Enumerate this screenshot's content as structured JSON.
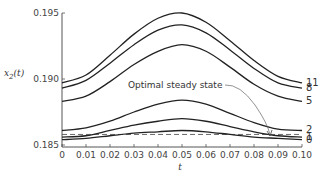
{
  "chart_data": {
    "type": "line",
    "title": "",
    "xlabel": "t",
    "ylabel": "x2(t)",
    "xlim": [
      0,
      0.1
    ],
    "ylim": [
      0.185,
      0.195
    ],
    "grid": false,
    "legend_position": "inline-right",
    "x_ticks": [
      "0",
      "0.01",
      "0.02",
      "0.03",
      "0.04",
      "0.05",
      "0.06",
      "0.07",
      "0.08",
      "0.09",
      "0.10"
    ],
    "y_ticks": [
      "0.185",
      "0.190",
      "0.195"
    ],
    "x": [
      0,
      0.01,
      0.02,
      0.03,
      0.04,
      0.05,
      0.06,
      0.07,
      0.08,
      0.09,
      0.1
    ],
    "series": [
      {
        "name": "11",
        "values": [
          0.1897,
          0.1903,
          0.1918,
          0.1934,
          0.1946,
          0.195,
          0.1943,
          0.1929,
          0.1914,
          0.1902,
          0.1897
        ]
      },
      {
        "name": "8",
        "values": [
          0.1893,
          0.1899,
          0.1912,
          0.1926,
          0.1937,
          0.1941,
          0.1935,
          0.1922,
          0.1908,
          0.1897,
          0.1893
        ]
      },
      {
        "name": "5",
        "values": [
          0.1883,
          0.1887,
          0.1898,
          0.1911,
          0.1921,
          0.1926,
          0.1921,
          0.1909,
          0.1896,
          0.1887,
          0.1883
        ]
      },
      {
        "name": "2",
        "values": [
          0.1861,
          0.1863,
          0.1868,
          0.1875,
          0.1881,
          0.1884,
          0.1881,
          0.1874,
          0.1867,
          0.1862,
          0.1861
        ]
      },
      {
        "name": "1",
        "values": [
          0.1856,
          0.1857,
          0.1861,
          0.1865,
          0.1868,
          0.187,
          0.1868,
          0.1864,
          0.186,
          0.1857,
          0.1856
        ]
      },
      {
        "name": "0",
        "values": [
          0.1854,
          0.1855,
          0.1857,
          0.1859,
          0.186,
          0.1861,
          0.186,
          0.1858,
          0.1856,
          0.1855,
          0.1854
        ]
      }
    ],
    "reference_lines": [
      {
        "name": "Optimal steady state",
        "style": "dashed",
        "y": 0.1858
      }
    ],
    "annotations": [
      {
        "text": "Optimal steady state",
        "arrow_to": [
          0.086,
          0.1858
        ]
      }
    ]
  },
  "labels": {
    "ylabel_main": "x",
    "ylabel_sub": "2",
    "ylabel_arg": "(t)",
    "xlabel": "t",
    "annotation": "Optimal steady state"
  }
}
